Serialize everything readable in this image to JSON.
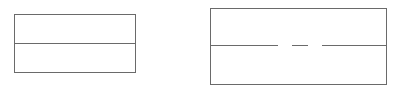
{
  "canvas": {
    "width": 401,
    "height": 92,
    "background_color": "#ffffff",
    "stroke_color": "#6a6a6a",
    "stroke_width": 1
  },
  "figures": [
    {
      "id": "left-figure",
      "name": "divided-rectangle-solid",
      "type": "rectangle",
      "x": 14,
      "y": 14,
      "width": 121,
      "height": 58,
      "right": 135,
      "bottom": 72,
      "outline_color": "#6a6a6a",
      "fill": "none",
      "divider": {
        "name": "horizontal-divider-solid",
        "style": "solid",
        "y": 43,
        "x_start": 14,
        "x_end": 135,
        "color": "#6a6a6a"
      },
      "bands": [
        {
          "name": "upper-band",
          "top": 14,
          "bottom": 43,
          "height": 29
        },
        {
          "name": "lower-band",
          "top": 43,
          "bottom": 72,
          "height": 29
        }
      ]
    },
    {
      "id": "right-figure",
      "name": "divided-rectangle-broken",
      "type": "rectangle",
      "x": 210,
      "y": 8,
      "width": 176,
      "height": 76,
      "right": 386,
      "bottom": 84,
      "outline_color": "#6a6a6a",
      "fill": "none",
      "divider": {
        "name": "horizontal-divider-broken",
        "style": "broken",
        "y": 45,
        "color": "#6a6a6a",
        "segments": [
          {
            "name": "left-segment",
            "x_start": 210,
            "x_end": 278,
            "length": 68
          },
          {
            "name": "center-dash",
            "x_start": 292,
            "x_end": 308,
            "length": 16
          },
          {
            "name": "right-segment",
            "x_start": 322,
            "x_end": 386,
            "length": 64
          }
        ],
        "gaps": [
          {
            "name": "left-gap",
            "x_start": 278,
            "x_end": 292,
            "length": 14
          },
          {
            "name": "right-gap",
            "x_start": 308,
            "x_end": 322,
            "length": 14
          }
        ]
      },
      "bands": [
        {
          "name": "upper-band",
          "top": 8,
          "bottom": 45,
          "height": 37
        },
        {
          "name": "lower-band",
          "top": 45,
          "bottom": 84,
          "height": 39
        }
      ]
    }
  ]
}
